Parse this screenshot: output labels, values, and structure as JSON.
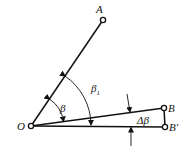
{
  "diagram": {
    "points": {
      "O": {
        "label": "O",
        "x": 31,
        "y": 126
      },
      "A": {
        "label": "A",
        "x": 103,
        "y": 20
      },
      "B": {
        "label": "B",
        "x": 164,
        "y": 108
      },
      "B_prime": {
        "label": "B′",
        "x": 165,
        "y": 127
      }
    },
    "angles": {
      "beta": {
        "symbol": "β"
      },
      "beta1": {
        "symbol": "β",
        "subscript": "1"
      },
      "delta_beta": {
        "symbol": "Δβ"
      }
    },
    "colors": {
      "stroke": "#111111",
      "background": "#ffffff"
    }
  }
}
